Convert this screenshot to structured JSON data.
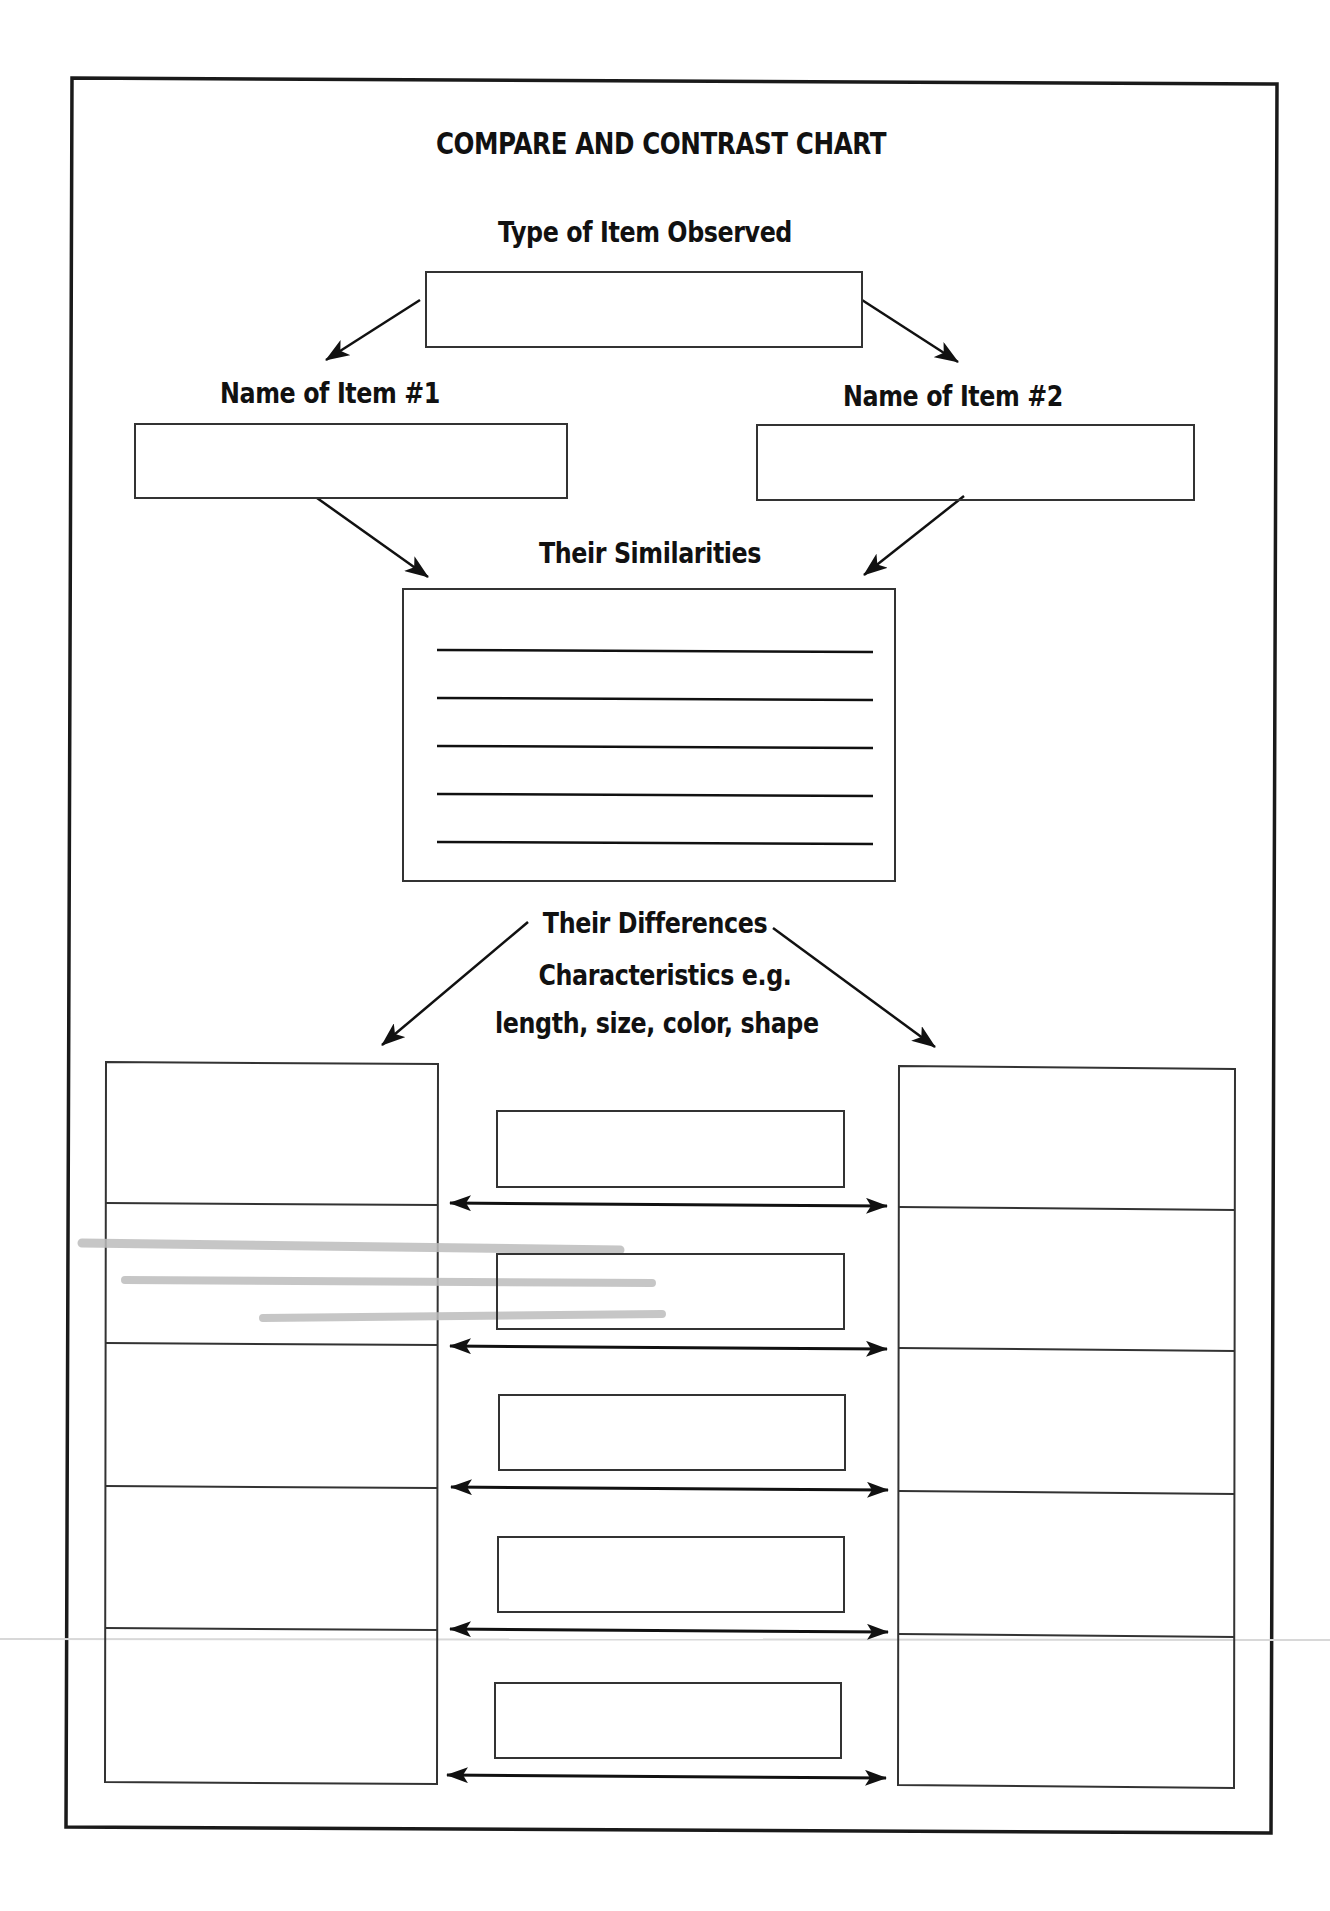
{
  "worksheet": {
    "title": "COMPARE AND CONTRAST CHART",
    "type_label": "Type of Item Observed",
    "item1_label": "Name of Item #1",
    "item2_label": "Name of Item #2",
    "similarities_label": "Their Similarities",
    "differences_label": "Their Differences",
    "characteristics_label_line1": "Characteristics e.g.",
    "characteristics_label_line2": "length, size, color, shape",
    "similarity_lines_count": 5,
    "difference_rows_count": 5,
    "fields": {
      "type_of_item": "",
      "item1_name": "",
      "item2_name": "",
      "similarities": [
        "",
        "",
        "",
        "",
        ""
      ],
      "item1_differences": [
        "",
        "",
        "",
        "",
        ""
      ],
      "characteristics": [
        "",
        "",
        "",
        "",
        ""
      ],
      "item2_differences": [
        "",
        "",
        "",
        "",
        ""
      ]
    }
  },
  "colors": {
    "ink": "#111111",
    "box_stroke": "#333333",
    "background": "#ffffff",
    "smudge": "#bdbdbd"
  }
}
